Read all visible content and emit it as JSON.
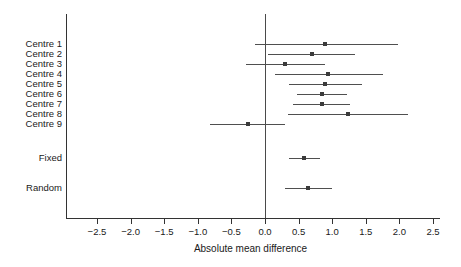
{
  "chart_data": {
    "type": "forest",
    "title": "",
    "xlabel": "Absolute mean difference",
    "ylabel": "",
    "xlim": [
      -2.9,
      2.6
    ],
    "xticks": [
      -2.5,
      -2.0,
      -1.5,
      -1.0,
      -0.5,
      0.0,
      0.5,
      1.0,
      1.5,
      2.0,
      2.5
    ],
    "xtick_labels": [
      "−2.5",
      "−2.0",
      "−1.5",
      "−1.0",
      "−0.5",
      "0.0",
      "0.5",
      "1.0",
      "1.5",
      "2.0",
      "2.5"
    ],
    "reference_line": 0.0,
    "grid": false,
    "legend": null,
    "rows": [
      {
        "label": "Centre 1",
        "estimate": 0.89,
        "ci_low": -0.15,
        "ci_high": 1.98,
        "group": "study"
      },
      {
        "label": "Centre 2",
        "estimate": 0.7,
        "ci_low": 0.05,
        "ci_high": 1.34,
        "group": "study"
      },
      {
        "label": "Centre 3",
        "estimate": 0.3,
        "ci_low": -0.28,
        "ci_high": 0.89,
        "group": "study"
      },
      {
        "label": "Centre 4",
        "estimate": 0.94,
        "ci_low": 0.15,
        "ci_high": 1.76,
        "group": "study"
      },
      {
        "label": "Centre 5",
        "estimate": 0.89,
        "ci_low": 0.36,
        "ci_high": 1.44,
        "group": "study"
      },
      {
        "label": "Centre 6",
        "estimate": 0.85,
        "ci_low": 0.48,
        "ci_high": 1.22,
        "group": "study"
      },
      {
        "label": "Centre 7",
        "estimate": 0.85,
        "ci_low": 0.42,
        "ci_high": 1.26,
        "group": "study"
      },
      {
        "label": "Centre 8",
        "estimate": 1.24,
        "ci_low": 0.34,
        "ci_high": 2.13,
        "group": "study"
      },
      {
        "label": "Centre 9",
        "estimate": -0.25,
        "ci_low": -0.82,
        "ci_high": 0.3,
        "group": "study"
      },
      {
        "label": "Fixed",
        "estimate": 0.58,
        "ci_low": 0.35,
        "ci_high": 0.82,
        "group": "summary"
      },
      {
        "label": "Random",
        "estimate": 0.64,
        "ci_low": 0.3,
        "ci_high": 1.0,
        "group": "summary"
      }
    ]
  },
  "colors": {
    "axis": "#333333",
    "zero_line": "#4a4a4a",
    "ci": "#4f4f4f",
    "marker": "#3a3a3a",
    "text": "#1a1a1a",
    "background": "#ffffff"
  }
}
